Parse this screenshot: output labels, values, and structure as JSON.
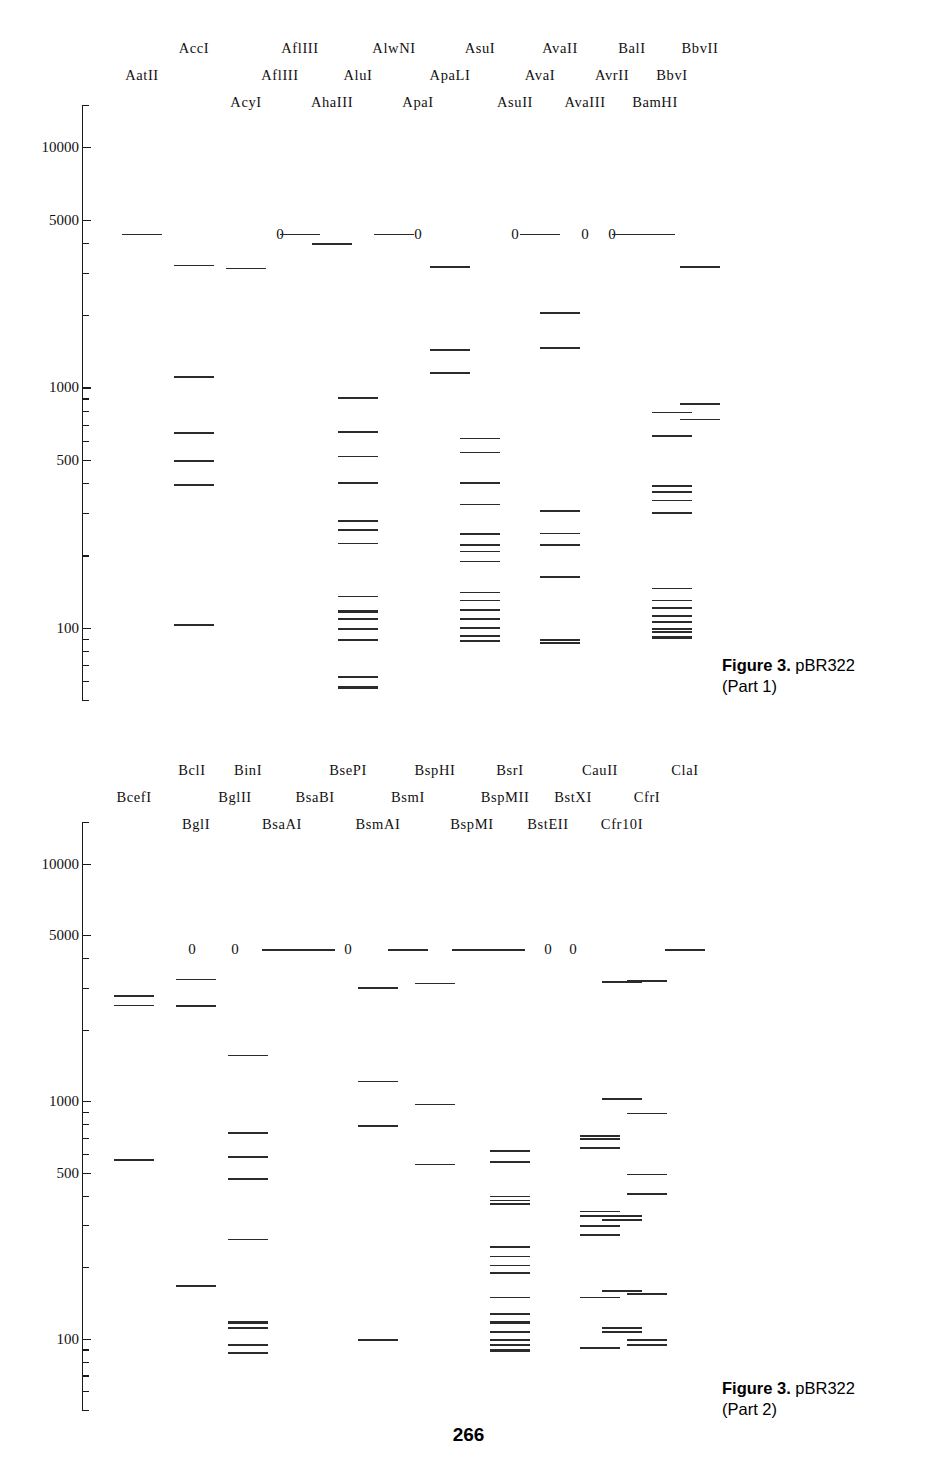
{
  "page": {
    "number": "266",
    "width": 937,
    "height": 1469
  },
  "panels": [
    {
      "id": "part1",
      "caption_bold": "Figure 3.",
      "caption_rest": " pBR322",
      "caption_part": "(Part 1)",
      "caption_x": 722,
      "caption_y": 655,
      "axis": {
        "x": 82,
        "top": 105,
        "bottom": 700,
        "labels": [
          "10000",
          "5000",
          "1000",
          "500",
          "100"
        ],
        "label_values": [
          10000,
          5000,
          1000,
          500,
          100
        ],
        "scale": "log",
        "units": "bp"
      },
      "label_rows_y": [
        40,
        67,
        94
      ],
      "lanes": [
        {
          "name": "AatII",
          "label_row": 1,
          "x": 142,
          "zero": false,
          "bands": [
            4361
          ]
        },
        {
          "name": "AccI",
          "label_row": 0,
          "x": 194,
          "zero": false,
          "bands": [
            3248,
            1113,
            653,
            499,
            396,
            104
          ]
        },
        {
          "name": "AcyI",
          "label_row": 2,
          "x": 246,
          "zero": false,
          "bands": [
            3150
          ]
        },
        {
          "name": "AflIII",
          "label_row": 1,
          "x": 280,
          "zero": true,
          "bands": []
        },
        {
          "name": "AflIII",
          "label_row": 0,
          "x": 300,
          "zero": false,
          "bands": [
            4361
          ]
        },
        {
          "name": "AhaIII",
          "label_row": 2,
          "x": 332,
          "zero": false,
          "bands": [
            3990
          ]
        },
        {
          "name": "AluI",
          "label_row": 1,
          "x": 358,
          "zero": false,
          "bands": [
            910,
            659,
            655,
            521,
            403,
            281,
            257,
            226,
            136,
            118,
            110,
            100,
            90,
            63,
            57
          ]
        },
        {
          "name": "AlwNI",
          "label_row": 0,
          "x": 394,
          "zero": false,
          "bands": [
            4361
          ]
        },
        {
          "name": "ApaI",
          "label_row": 2,
          "x": 418,
          "zero": true,
          "bands": []
        },
        {
          "name": "ApaLI",
          "label_row": 1,
          "x": 450,
          "zero": false,
          "bands": [
            3192,
            1444,
            1160
          ]
        },
        {
          "name": "AsuI",
          "label_row": 0,
          "x": 480,
          "zero": false,
          "bands": [
            617,
            540,
            404,
            328,
            247,
            222,
            209,
            190,
            141,
            131,
            120,
            110,
            101,
            93,
            89
          ]
        },
        {
          "name": "AsuII",
          "label_row": 2,
          "x": 515,
          "zero": true,
          "bands": []
        },
        {
          "name": "AvaI",
          "label_row": 1,
          "x": 540,
          "zero": false,
          "bands": [
            4361
          ]
        },
        {
          "name": "AvaII",
          "label_row": 0,
          "x": 560,
          "zero": false,
          "bands": [
            2061,
            1474,
            309,
            249,
            222,
            164,
            90,
            87
          ]
        },
        {
          "name": "AvaIII",
          "label_row": 2,
          "x": 585,
          "zero": true,
          "bands": []
        },
        {
          "name": "AvrII",
          "label_row": 1,
          "x": 612,
          "zero": true,
          "bands": []
        },
        {
          "name": "BalI",
          "label_row": 0,
          "x": 632,
          "zero": false,
          "bands": [
            4361
          ]
        },
        {
          "name": "BamHI",
          "label_row": 2,
          "x": 655,
          "zero": false,
          "bands": [
            4361
          ]
        },
        {
          "name": "BbvI",
          "label_row": 1,
          "x": 672,
          "zero": false,
          "bands": [
            792,
            634,
            392,
            370,
            341,
            303,
            147,
            131,
            122,
            113,
            107,
            100,
            97,
            92
          ]
        },
        {
          "name": "BbvII",
          "label_row": 0,
          "x": 700,
          "zero": false,
          "bands": [
            3200,
            860,
            741
          ]
        }
      ]
    },
    {
      "id": "part2",
      "caption_bold": "Figure 3.",
      "caption_rest": " pBR322",
      "caption_part": "(Part 2)",
      "caption_x": 722,
      "caption_y": 1378,
      "axis": {
        "x": 82,
        "top": 822,
        "bottom": 1410,
        "labels": [
          "10000",
          "5000",
          "1000",
          "500",
          "100"
        ],
        "label_values": [
          10000,
          5000,
          1000,
          500,
          100
        ],
        "scale": "log",
        "units": "bp"
      },
      "label_rows_y": [
        762,
        789,
        816
      ],
      "lanes": [
        {
          "name": "BcefI",
          "label_row": 1,
          "x": 134,
          "zero": false,
          "bands": [
            2800,
            2550,
            570
          ]
        },
        {
          "name": "BclI",
          "label_row": 0,
          "x": 192,
          "zero": true,
          "bands": []
        },
        {
          "name": "BglI",
          "label_row": 2,
          "x": 196,
          "zero": false,
          "bands": [
            3280,
            2540,
            168
          ]
        },
        {
          "name": "BglII",
          "label_row": 1,
          "x": 235,
          "zero": true,
          "bands": []
        },
        {
          "name": "BinI",
          "label_row": 0,
          "x": 248,
          "zero": false,
          "bands": [
            1570,
            740,
            588,
            474,
            263,
            118,
            112,
            95,
            88
          ]
        },
        {
          "name": "BsaAI",
          "label_row": 2,
          "x": 282,
          "zero": false,
          "bands": [
            4361
          ]
        },
        {
          "name": "BsaBI",
          "label_row": 1,
          "x": 315,
          "zero": false,
          "bands": [
            4361
          ]
        },
        {
          "name": "BsePI",
          "label_row": 0,
          "x": 348,
          "zero": true,
          "bands": []
        },
        {
          "name": "BsmAI",
          "label_row": 2,
          "x": 378,
          "zero": false,
          "bands": [
            3020,
            1220,
            790,
            100
          ]
        },
        {
          "name": "BsmI",
          "label_row": 1,
          "x": 408,
          "zero": false,
          "bands": [
            4361
          ]
        },
        {
          "name": "BspHI",
          "label_row": 0,
          "x": 435,
          "zero": false,
          "bands": [
            3150,
            975,
            545
          ]
        },
        {
          "name": "BspMI",
          "label_row": 2,
          "x": 472,
          "zero": false,
          "bands": [
            4361
          ]
        },
        {
          "name": "BspMII",
          "label_row": 1,
          "x": 505,
          "zero": false,
          "bands": [
            4361
          ]
        },
        {
          "name": "BsrI",
          "label_row": 0,
          "x": 510,
          "zero": false,
          "bands": [
            620,
            560,
            400,
            385,
            372,
            245,
            223,
            205,
            190,
            150,
            128,
            118,
            108,
            100,
            95,
            90
          ]
        },
        {
          "name": "BstEII",
          "label_row": 2,
          "x": 548,
          "zero": true,
          "bands": []
        },
        {
          "name": "BstXI",
          "label_row": 1,
          "x": 573,
          "zero": true,
          "bands": []
        },
        {
          "name": "CauII",
          "label_row": 0,
          "x": 600,
          "zero": false,
          "bands": [
            718,
            697,
            640,
            345,
            330,
            300,
            275,
            150,
            92
          ]
        },
        {
          "name": "Cfr10I",
          "label_row": 2,
          "x": 622,
          "zero": false,
          "bands": [
            3200,
            1030,
            330,
            318,
            160,
            112,
            108
          ]
        },
        {
          "name": "CfrI",
          "label_row": 1,
          "x": 647,
          "zero": false,
          "bands": [
            3230,
            895,
            495,
            410,
            155,
            100,
            95
          ]
        },
        {
          "name": "ClaI",
          "label_row": 0,
          "x": 685,
          "zero": false,
          "bands": [
            4361
          ]
        }
      ]
    }
  ],
  "chart_data": {
    "type": "scatter",
    "xlabel": "Restriction enzyme",
    "ylabel": "Fragment size (bp)",
    "ylim": [
      50,
      15000
    ],
    "yscale": "log",
    "ytick_labels": [
      "10000",
      "5000",
      "1000",
      "500",
      "100"
    ],
    "grid": false,
    "legend": "none",
    "note": "Each lane is one restriction enzyme digest of plasmid pBR322 (4361 bp). Horizontal marks are DNA fragment bands at their size on the log axis. A '0' above a lane means the enzyme does not cut pBR322."
  }
}
